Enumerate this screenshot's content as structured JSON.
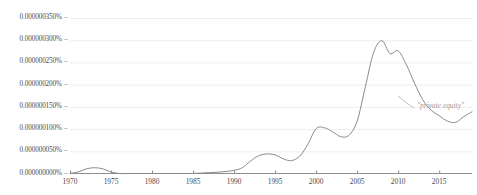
{
  "chart_data": {
    "type": "line",
    "title": "",
    "xlabel": "",
    "ylabel": "",
    "grid": true,
    "legend_position": "inline-right",
    "xlim": [
      1970,
      2019
    ],
    "ylim": [
      0,
      3.5e-07
    ],
    "ytick_labels": [
      "0.000000350%",
      "0.000000300%",
      "0.000000250%",
      "0.000000200%",
      "0.000000150%",
      "0.000000100%",
      "0.000000050%",
      "0.000000000%"
    ],
    "ytick_values": [
      3.5e-07,
      3e-07,
      2.5e-07,
      2e-07,
      1.5e-07,
      1e-07,
      5e-08,
      0
    ],
    "ytick_mark": "–",
    "xtick_labels": [
      "1970",
      "1975",
      "1980",
      "1985",
      "1990",
      "1995",
      "2000",
      "2005",
      "2010",
      "2015"
    ],
    "xtick_values": [
      1970,
      1975,
      1980,
      1985,
      1990,
      1995,
      2000,
      2005,
      2010,
      2015
    ],
    "series": [
      {
        "name": "\"private equity\"",
        "color": "#8a8a8a",
        "x": [
          1970,
          1971,
          1972,
          1973,
          1974,
          1975,
          1976,
          1977,
          1978,
          1979,
          1980,
          1981,
          1982,
          1983,
          1984,
          1985,
          1986,
          1987,
          1988,
          1989,
          1990,
          1991,
          1992,
          1993,
          1994,
          1995,
          1996,
          1997,
          1998,
          1999,
          2000,
          2001,
          2002,
          2003,
          2004,
          2005,
          2006,
          2007,
          2008,
          2009,
          2010,
          2011,
          2012,
          2013,
          2014,
          2015,
          2016,
          2017,
          2018,
          2019
        ],
        "values": [
          0.0,
          3.5e-09,
          1.05e-08,
          1.3e-08,
          1.05e-08,
          3.5e-09,
          0.0,
          0.0,
          0.0,
          0.0,
          0.0,
          0.0,
          0.0,
          0.0,
          0.0,
          0.0,
          1e-09,
          2e-09,
          3e-09,
          4.5e-09,
          7e-09,
          1.3e-08,
          2.8e-08,
          4e-08,
          4.4e-08,
          4.2e-08,
          3.3e-08,
          2.9e-08,
          3.9e-08,
          6.6e-08,
          1.01e-07,
          1.03e-07,
          9.4e-08,
          8.3e-08,
          8.6e-08,
          1.18e-07,
          1.95e-07,
          2.72e-07,
          2.99e-07,
          2.7e-07,
          2.76e-07,
          2.45e-07,
          2.03e-07,
          1.66e-07,
          1.43e-07,
          1.3e-07,
          1.18e-07,
          1.15e-07,
          1.28e-07,
          1.39e-07
        ],
        "annotation": "\"private equity\""
      }
    ]
  }
}
